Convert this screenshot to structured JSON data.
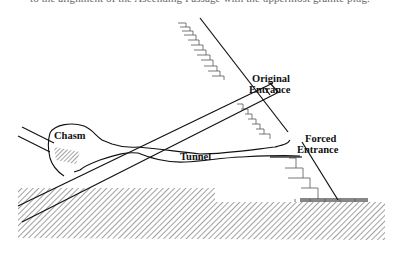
{
  "caption_fragment": "to the alignment of the Ascending Passage with the uppermost granite plug.",
  "diagram": {
    "labels": {
      "original_entrance_line1": "Original",
      "original_entrance_line2": "Entrance",
      "forced_entrance_line1": "Forced",
      "forced_entrance_line2": "Entrance",
      "chasm": "Chasm",
      "tunnel": "Tunnel"
    },
    "colors": {
      "line": "#111111",
      "hatch": "#444444",
      "background": "#ffffff"
    }
  }
}
